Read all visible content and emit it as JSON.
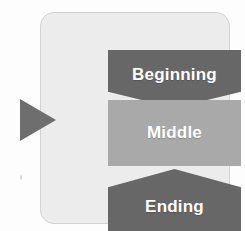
{
  "diagram": {
    "panel": {
      "background_color": "#ececec",
      "border_color": "#d2d2d2"
    },
    "pointer": {
      "icon": "play-triangle-right-icon",
      "color": "#6e6e6e",
      "points_to": "Middle"
    },
    "stages": [
      {
        "label": "Beginning",
        "shape": "pentagon-down",
        "fill_color": "#676767",
        "text_color": "#ffffff"
      },
      {
        "label": "Middle",
        "shape": "rectangle",
        "fill_color": "#a9a9a9",
        "text_color": "#ffffff"
      },
      {
        "label": "Ending",
        "shape": "pentagon-up",
        "fill_color": "#676767",
        "text_color": "#ffffff"
      }
    ]
  }
}
